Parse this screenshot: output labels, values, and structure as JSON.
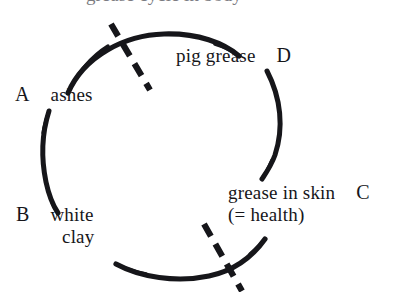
{
  "figure": {
    "type": "cycle-diagram",
    "background_color": "#ffffff",
    "ink_color": "#16161a",
    "top_clipped_caption": "grease cycle in body",
    "nodes": [
      {
        "key": "A",
        "label": "ashes",
        "sub": "",
        "position": "left-upper"
      },
      {
        "key": "B",
        "label": "white",
        "sub": "clay",
        "position": "left-lower"
      },
      {
        "key": "C",
        "label": "grease in skin",
        "sub": "(= health)",
        "position": "right-lower"
      },
      {
        "key": "D",
        "label": "pig grease",
        "sub": "",
        "position": "right-upper"
      }
    ],
    "arcs": [
      {
        "name": "arc-top",
        "from_key": "A",
        "to_key": "D"
      },
      {
        "name": "arc-right",
        "from_key": "D",
        "to_key": "C"
      },
      {
        "name": "arc-bottom",
        "from_key": "C",
        "to_key": "B"
      },
      {
        "name": "arc-left",
        "from_key": "B",
        "to_key": "A"
      }
    ],
    "dashed_cuts": [
      {
        "name": "dash-top-left",
        "crosses_arc": "arc-top"
      },
      {
        "name": "dash-bottom-right",
        "crosses_arc": "arc-bottom"
      }
    ]
  },
  "labels": {
    "a": {
      "key": "A",
      "text": "ashes"
    },
    "b": {
      "key": "B",
      "text": "white",
      "text2": "clay"
    },
    "c": {
      "key": "C",
      "text": "grease in skin",
      "text2": "(= health)"
    },
    "d": {
      "key": "D",
      "text": "pig grease"
    }
  }
}
